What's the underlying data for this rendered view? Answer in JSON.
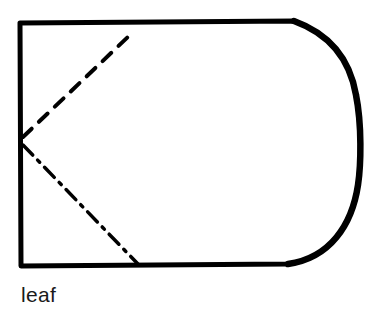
{
  "diagram": {
    "title": "leaf",
    "shape": "rounded-right rectangle",
    "stroke_color": "#000000",
    "background_color": "#ffffff",
    "fold_lines": [
      {
        "name": "upper-fold-line",
        "style": "dashed",
        "from": [
          22,
          138
        ],
        "to": [
          131,
          34
        ]
      },
      {
        "name": "lower-fold-line",
        "style": "dash-dot",
        "from": [
          22,
          145
        ],
        "to": [
          138,
          264
        ]
      }
    ]
  },
  "caption": {
    "label": "leaf"
  }
}
